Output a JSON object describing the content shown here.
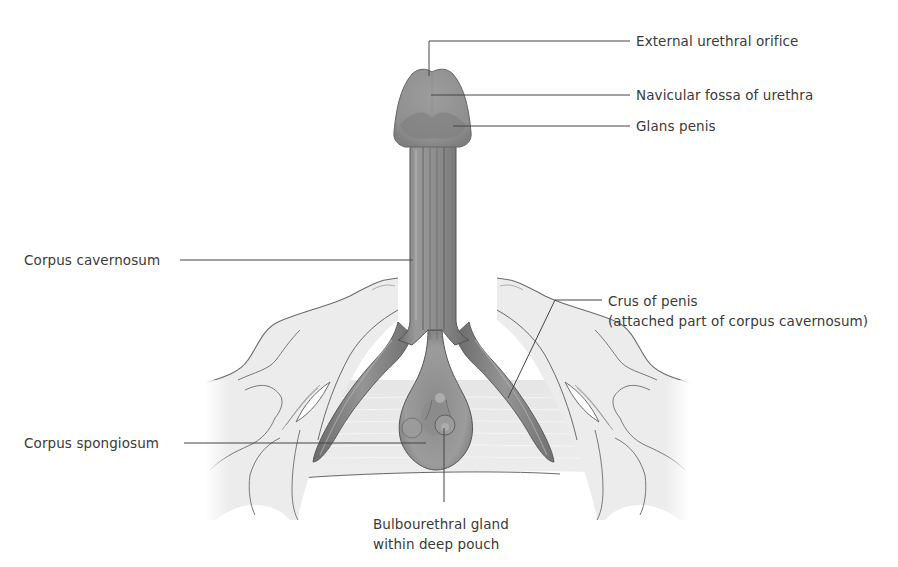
{
  "figure": {
    "colors": {
      "background": "#ffffff",
      "tissue_dark": "#7c7c7c",
      "tissue_mid": "#8f8f8f",
      "tissue_light": "#a8a8a8",
      "bone_fill": "#ececec",
      "bone_outline": "#6b6b6b",
      "membrane_fill": "#e4e4e4",
      "leader_line": "#444444",
      "label_text": "#3a3a3a"
    }
  },
  "labels": {
    "external_urethral_orifice": "External urethral orifice",
    "navicular_fossa": "Navicular fossa of urethra",
    "glans_penis": "Glans penis",
    "corpus_cavernosum": "Corpus cavernosum",
    "crus_of_penis": "Crus of penis\n(attached part of corpus cavernosum)",
    "corpus_spongiosum": "Corpus spongiosum",
    "bulbourethral_gland": "Bulbourethral gland\nwithin deep pouch"
  }
}
